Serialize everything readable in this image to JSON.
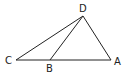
{
  "diagram": {
    "type": "triangle",
    "points": {
      "A": {
        "label": "A",
        "x": 111,
        "y": 60
      },
      "B": {
        "label": "B",
        "x": 50,
        "y": 60
      },
      "C": {
        "label": "C",
        "x": 16,
        "y": 60
      },
      "D": {
        "label": "D",
        "x": 83,
        "y": 16
      }
    },
    "segments": [
      "CA",
      "CD",
      "BD",
      "DA"
    ],
    "stroke_color": "#222222"
  }
}
